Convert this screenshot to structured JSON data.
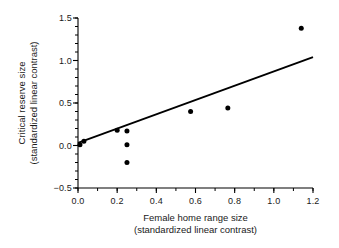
{
  "chart_data": {
    "type": "scatter",
    "title": "",
    "xlabel": "Female home range size (standardized linear contrast)",
    "ylabel": "Critical reserve size (standardized linear contrast)",
    "xlabel_line1": "Female home range size",
    "xlabel_line2": "(standardized linear contrast)",
    "ylabel_line1": "Critical reserve size",
    "ylabel_line2": "(standardized linear contrast)",
    "xlim": [
      0.0,
      1.2
    ],
    "ylim": [
      -0.5,
      1.5
    ],
    "xticks": [
      0.0,
      0.2,
      0.4,
      0.6,
      0.8,
      1.0,
      1.2
    ],
    "xticklabels": [
      "0.0",
      "0.2",
      "0.4",
      "0.6",
      "0.8",
      "1.0",
      "1.2"
    ],
    "yticks": [
      -0.5,
      0.0,
      0.5,
      1.0,
      1.5
    ],
    "yticklabels": [
      "−0.5",
      "0.0",
      "0.5",
      "1.0",
      "1.5"
    ],
    "x_minor_tick_interval": 0.1,
    "y_minor_tick_interval": 0.1,
    "grid": false,
    "legend": null,
    "marker": "filled-circle",
    "marker_color": "#000000",
    "marker_size_px": 5,
    "axis_color": "#000000",
    "points": [
      {
        "x": 0.01,
        "y": 0.01
      },
      {
        "x": 0.03,
        "y": 0.05
      },
      {
        "x": 0.2,
        "y": 0.18
      },
      {
        "x": 0.25,
        "y": 0.17
      },
      {
        "x": 0.25,
        "y": 0.01
      },
      {
        "x": 0.25,
        "y": -0.2
      },
      {
        "x": 0.575,
        "y": 0.4
      },
      {
        "x": 0.765,
        "y": 0.44
      },
      {
        "x": 1.14,
        "y": 1.38
      }
    ],
    "series": [
      {
        "name": "observations",
        "x": [
          0.01,
          0.03,
          0.2,
          0.25,
          0.25,
          0.25,
          0.575,
          0.765,
          1.14
        ],
        "values": [
          0.01,
          0.05,
          0.18,
          0.17,
          0.01,
          -0.2,
          0.4,
          0.44,
          1.38
        ]
      }
    ],
    "trendline": {
      "type": "linear-regression",
      "x_start": 0.0,
      "y_start": 0.03,
      "x_end": 1.2,
      "y_end": 1.04,
      "color": "#000000",
      "width_px": 1.8
    }
  }
}
